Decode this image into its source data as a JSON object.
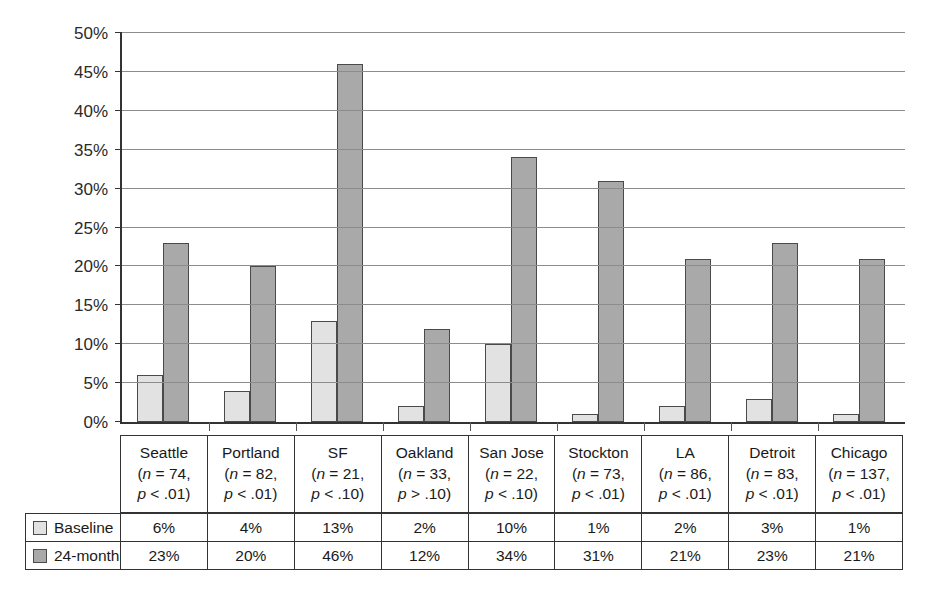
{
  "chart_data": {
    "type": "bar",
    "title": "",
    "xlabel": "",
    "ylabel": "",
    "ylim": [
      0,
      50
    ],
    "ytick_values": [
      0,
      5,
      10,
      15,
      20,
      25,
      30,
      35,
      40,
      45,
      50
    ],
    "ytick_labels": [
      "0%",
      "5%",
      "10%",
      "15%",
      "20%",
      "25%",
      "30%",
      "35%",
      "40%",
      "45%",
      "50%"
    ],
    "grid": true,
    "legend_position": "bottom-table",
    "categories": [
      "Seattle",
      "Portland",
      "SF",
      "Oakland",
      "San Jose",
      "Stockton",
      "LA",
      "Detroit",
      "Chicago"
    ],
    "series": [
      {
        "name": "Baseline",
        "color": "#e2e2e2",
        "values": [
          6,
          4,
          13,
          2,
          10,
          1,
          2,
          3,
          1
        ],
        "labels": [
          "6%",
          "4%",
          "13%",
          "2%",
          "10%",
          "1%",
          "2%",
          "3%",
          "1%"
        ]
      },
      {
        "name": "24-month",
        "color": "#a9a9a9",
        "values": [
          23,
          20,
          46,
          12,
          34,
          31,
          21,
          23,
          21
        ],
        "labels": [
          "23%",
          "20%",
          "46%",
          "12%",
          "34%",
          "31%",
          "21%",
          "23%",
          "21%"
        ]
      }
    ],
    "category_annotations": [
      {
        "name": "Seattle",
        "n": "(n = 74,",
        "p": "p < .01)"
      },
      {
        "name": "Portland",
        "n": "(n = 82,",
        "p": "p < .01)"
      },
      {
        "name": "SF",
        "n": "(n = 21,",
        "p": "p < .10)"
      },
      {
        "name": "Oakland",
        "n": "(n = 33,",
        "p": "p > .10)"
      },
      {
        "name": "San Jose",
        "n": "(n = 22,",
        "p": "p < .10)"
      },
      {
        "name": "Stockton",
        "n": "(n = 73,",
        "p": "p < .01)"
      },
      {
        "name": "LA",
        "n": "(n = 86,",
        "p": "p < .01)"
      },
      {
        "name": "Detroit",
        "n": "(n = 83,",
        "p": "p < .01)"
      },
      {
        "name": "Chicago",
        "n": "(n = 137,",
        "p": "p < .01)"
      }
    ]
  },
  "legend": {
    "baseline_label": "Baseline",
    "month24_label": "24-month"
  },
  "colors": {
    "baseline_fill": "#e2e2e2",
    "month24_fill": "#a9a9a9",
    "bar_outline": "#4a4a4a",
    "axis": "#333333",
    "gridline": "#8c8c8c"
  }
}
